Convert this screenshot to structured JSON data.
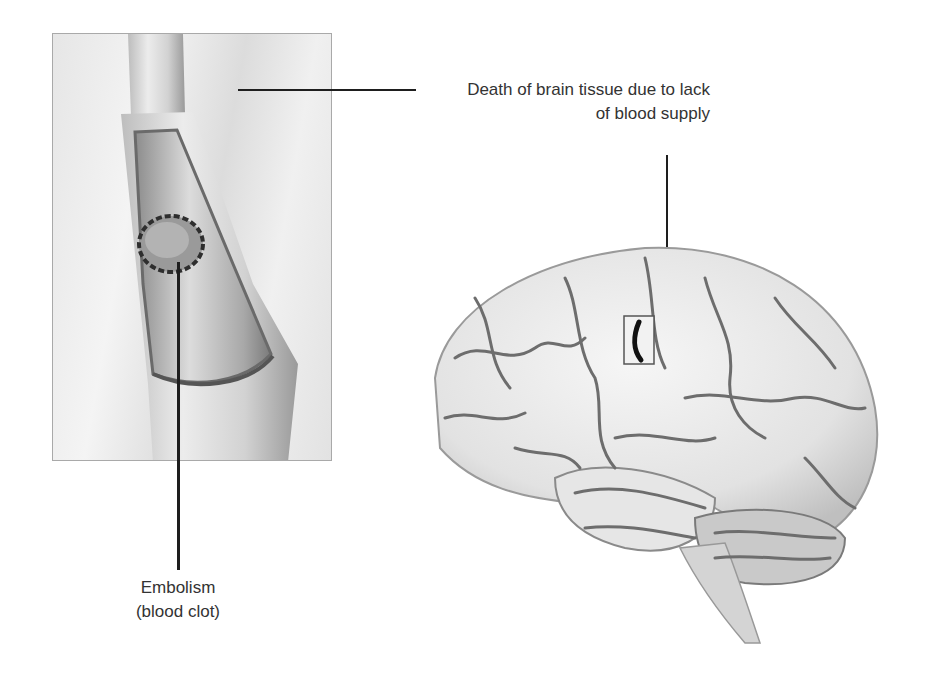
{
  "figure": {
    "labels": {
      "infarct_line1": "Death of brain tissue due to lack",
      "infarct_line2": "of blood supply",
      "embolism_line1": "Embolism",
      "embolism_line2": "(blood clot)"
    },
    "panels": {
      "vessel": {
        "description": "Cutaway blood vessel with lodged clot"
      },
      "brain": {
        "description": "Lateral view of brain with highlighted infarct region"
      }
    },
    "colors": {
      "leader": "#1e1e1e",
      "panel_border": "#a9a9a9",
      "text": "#333333"
    }
  }
}
